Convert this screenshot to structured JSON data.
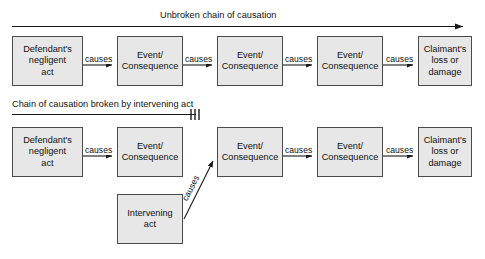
{
  "diagram": {
    "background_color": "#ffffff",
    "node_fill_color": "#e7e7e7",
    "node_border_color": "#4a4a4a",
    "line_color": "#1a1a1a",
    "text_color": "#111111"
  },
  "top_section": {
    "caption": "Unbroken chain of causation",
    "arrow_direction": "left-to-right",
    "nodes": [
      {
        "id": "d-negligent-act",
        "label": "Defendant's\nnegligent\nact"
      },
      {
        "id": "event-1",
        "label": "Event/\nConsequence"
      },
      {
        "id": "event-2",
        "label": "Event/\nConsequence"
      },
      {
        "id": "event-3",
        "label": "Event/\nConsequence"
      },
      {
        "id": "claimant-loss",
        "label": "Claimant's\nloss or\ndamage"
      }
    ],
    "edge_labels": [
      "causes",
      "causes",
      "causes",
      "causes"
    ]
  },
  "bottom_section": {
    "caption": "Chain of causation broken by intervening act",
    "break_marker": "|||",
    "nodes": [
      {
        "id": "d-negligent-act-2",
        "label": "Defendant's\nnegligent\nact"
      },
      {
        "id": "event-4",
        "label": "Event/\nConsequence"
      },
      {
        "id": "event-5",
        "label": "Event/\nConsequence"
      },
      {
        "id": "event-6",
        "label": "Event/\nConsequence"
      },
      {
        "id": "claimant-loss-2",
        "label": "Claimant's\nloss or\ndamage"
      },
      {
        "id": "intervening-act",
        "label": "Intervening\nact"
      }
    ],
    "edge_labels": [
      "causes",
      "causes",
      "causes"
    ],
    "intervening_edge_label": "causes"
  }
}
